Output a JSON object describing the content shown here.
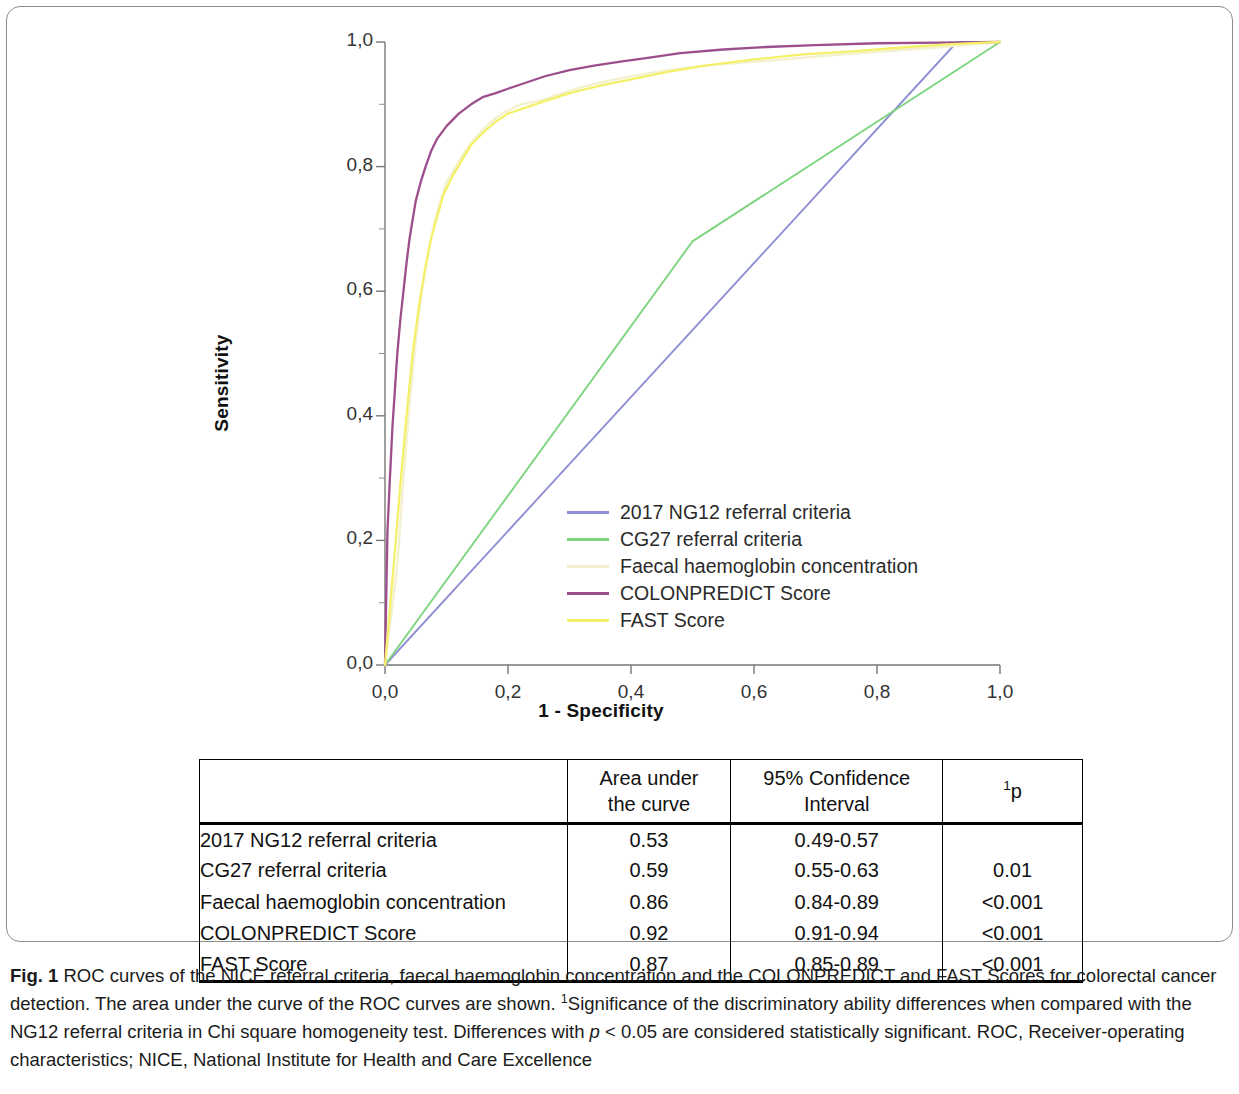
{
  "figure": {
    "label": "Fig. 1",
    "caption_text": " ROC curves of the NICE referral criteria, faecal haemoglobin concentration and the COLONPREDICT and FAST Scores for colorectal cancer detection. The area under the curve of the ROC curves are shown. ",
    "caption_sup": "1",
    "caption_text2": "Significance of the discriminatory ability differences when compared with the NG12 referral criteria in Chi square homogeneity test. Differences with ",
    "caption_italic_p": "p",
    "caption_text3": " < 0.05 are considered statistically significant. ROC, Receiver-operating characteristics; NICE, National Institute for Health and Care Excellence"
  },
  "chart_data": {
    "type": "line",
    "title": "",
    "xlabel": "1 - Specificity",
    "ylabel": "Sensitivity",
    "xlim": [
      0,
      1
    ],
    "ylim": [
      0,
      1
    ],
    "grid": false,
    "legend_position": "inside-center",
    "xticks": [
      "0,0",
      "0,2",
      "0,4",
      "0,6",
      "0,8",
      "1,0"
    ],
    "xtick_values": [
      0.0,
      0.2,
      0.4,
      0.6,
      0.8,
      1.0
    ],
    "yticks": [
      "0,0",
      "0,2",
      "0,4",
      "0,6",
      "0,8",
      "1,0"
    ],
    "ytick_values": [
      0.0,
      0.2,
      0.4,
      0.6,
      0.8,
      1.0
    ],
    "series": [
      {
        "name": "2017 NG12 referral criteria",
        "color": "#8f8fd4",
        "points": [
          [
            0.0,
            0.0
          ],
          [
            0.93,
            1.0
          ],
          [
            1.0,
            1.0
          ]
        ]
      },
      {
        "name": "CG27 referral criteria",
        "color": "#7fd47f",
        "points": [
          [
            0.0,
            0.0
          ],
          [
            0.5,
            0.68
          ],
          [
            1.0,
            1.0
          ]
        ]
      },
      {
        "name": "Faecal haemoglobin concentration",
        "color": "#f3f0cd",
        "points": [
          [
            0.0,
            0.0
          ],
          [
            0.02,
            0.16
          ],
          [
            0.03,
            0.3
          ],
          [
            0.04,
            0.42
          ],
          [
            0.05,
            0.52
          ],
          [
            0.06,
            0.6
          ],
          [
            0.07,
            0.66
          ],
          [
            0.08,
            0.71
          ],
          [
            0.09,
            0.745
          ],
          [
            0.1,
            0.775
          ],
          [
            0.115,
            0.8
          ],
          [
            0.13,
            0.825
          ],
          [
            0.15,
            0.85
          ],
          [
            0.17,
            0.87
          ],
          [
            0.19,
            0.885
          ],
          [
            0.22,
            0.9
          ],
          [
            0.25,
            0.905
          ],
          [
            0.28,
            0.915
          ],
          [
            0.31,
            0.925
          ],
          [
            0.35,
            0.935
          ],
          [
            0.4,
            0.945
          ],
          [
            0.46,
            0.955
          ],
          [
            0.52,
            0.962
          ],
          [
            0.58,
            0.967
          ],
          [
            0.65,
            0.972
          ],
          [
            0.72,
            0.978
          ],
          [
            0.8,
            0.984
          ],
          [
            0.88,
            0.99
          ],
          [
            0.95,
            0.996
          ],
          [
            1.0,
            1.0
          ]
        ]
      },
      {
        "name": "COLONPREDICT Score",
        "color": "#9c4f8c",
        "points": [
          [
            0.0,
            0.0
          ],
          [
            0.004,
            0.215
          ],
          [
            0.008,
            0.3
          ],
          [
            0.012,
            0.38
          ],
          [
            0.016,
            0.44
          ],
          [
            0.02,
            0.5
          ],
          [
            0.025,
            0.555
          ],
          [
            0.03,
            0.6
          ],
          [
            0.035,
            0.645
          ],
          [
            0.04,
            0.685
          ],
          [
            0.045,
            0.715
          ],
          [
            0.05,
            0.745
          ],
          [
            0.058,
            0.775
          ],
          [
            0.066,
            0.8
          ],
          [
            0.075,
            0.825
          ],
          [
            0.085,
            0.845
          ],
          [
            0.1,
            0.865
          ],
          [
            0.12,
            0.885
          ],
          [
            0.14,
            0.9
          ],
          [
            0.16,
            0.912
          ],
          [
            0.18,
            0.918
          ],
          [
            0.2,
            0.925
          ],
          [
            0.23,
            0.935
          ],
          [
            0.26,
            0.945
          ],
          [
            0.3,
            0.955
          ],
          [
            0.34,
            0.962
          ],
          [
            0.38,
            0.968
          ],
          [
            0.43,
            0.975
          ],
          [
            0.48,
            0.982
          ],
          [
            0.55,
            0.988
          ],
          [
            0.62,
            0.992
          ],
          [
            0.7,
            0.995
          ],
          [
            0.8,
            0.998
          ],
          [
            0.9,
            0.999
          ],
          [
            1.0,
            1.0
          ]
        ]
      },
      {
        "name": "FAST Score",
        "color": "#f5f06a",
        "points": [
          [
            0.0,
            0.0
          ],
          [
            0.015,
            0.17
          ],
          [
            0.025,
            0.29
          ],
          [
            0.035,
            0.4
          ],
          [
            0.045,
            0.5
          ],
          [
            0.055,
            0.575
          ],
          [
            0.065,
            0.635
          ],
          [
            0.075,
            0.685
          ],
          [
            0.085,
            0.72
          ],
          [
            0.095,
            0.755
          ],
          [
            0.11,
            0.785
          ],
          [
            0.125,
            0.81
          ],
          [
            0.14,
            0.835
          ],
          [
            0.16,
            0.855
          ],
          [
            0.18,
            0.872
          ],
          [
            0.2,
            0.885
          ],
          [
            0.23,
            0.895
          ],
          [
            0.26,
            0.905
          ],
          [
            0.3,
            0.918
          ],
          [
            0.35,
            0.93
          ],
          [
            0.4,
            0.94
          ],
          [
            0.46,
            0.952
          ],
          [
            0.52,
            0.962
          ],
          [
            0.6,
            0.972
          ],
          [
            0.68,
            0.98
          ],
          [
            0.76,
            0.985
          ],
          [
            0.85,
            0.992
          ],
          [
            0.93,
            0.997
          ],
          [
            1.0,
            1.0
          ]
        ]
      }
    ]
  },
  "table": {
    "headers": {
      "row_label": "",
      "auc_line1": "Area under",
      "auc_line2": "the curve",
      "ci_line1": "95% Confidence",
      "ci_line2": "Interval",
      "p_sup": "1",
      "p_text": "p"
    },
    "rows": [
      {
        "name": "2017 NG12 referral criteria",
        "auc": "0.53",
        "ci": "0.49-0.57",
        "p": ""
      },
      {
        "name": "CG27 referral criteria",
        "auc": "0.59",
        "ci": "0.55-0.63",
        "p": "0.01"
      },
      {
        "name": "Faecal haemoglobin concentration",
        "auc": "0.86",
        "ci": "0.84-0.89",
        "p": "<0.001"
      },
      {
        "name": "COLONPREDICT Score",
        "auc": "0.92",
        "ci": "0.91-0.94",
        "p": "<0.001"
      },
      {
        "name": "FAST Score",
        "auc": "0.87",
        "ci": "0.85-0.89",
        "p": "<0.001"
      }
    ]
  }
}
